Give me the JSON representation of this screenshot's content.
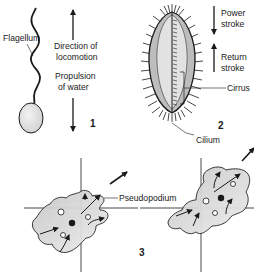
{
  "diagram": {
    "panels": [
      {
        "number": "1",
        "type": "flagellum",
        "labels": {
          "flagellum": "Flagellum",
          "direction_1": "Direction of",
          "direction_2": "locomotion",
          "propulsion_1": "Propulsion",
          "propulsion_2": "of water"
        }
      },
      {
        "number": "2",
        "type": "cilia",
        "labels": {
          "power_1": "Power",
          "power_2": "stroke",
          "return_1": "Return",
          "return_2": "stroke",
          "cirrus": "Cirrus",
          "cilium": "Cilium"
        }
      },
      {
        "number": "3",
        "type": "amoeboid",
        "labels": {
          "pseudopodium": "Pseudopodium"
        }
      }
    ],
    "colors": {
      "line": "#1a1a1a",
      "cell_fill": "#d4d4d4",
      "cell_fill_light": "#e8e8e8",
      "background": "#ffffff"
    }
  }
}
